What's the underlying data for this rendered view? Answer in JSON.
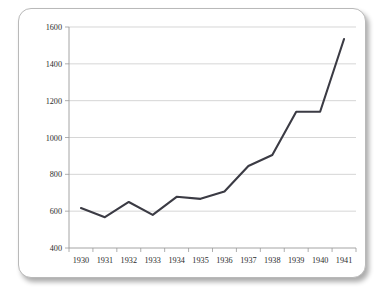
{
  "chart_data": {
    "type": "line",
    "title": "",
    "subtitle": "",
    "xlabel": "",
    "ylabel": "",
    "categories": [
      "1930",
      "1931",
      "1932",
      "1933",
      "1934",
      "1935",
      "1936",
      "1937",
      "1938",
      "1939",
      "1940",
      "1941"
    ],
    "x": [
      1930,
      1931,
      1932,
      1933,
      1934,
      1935,
      1936,
      1937,
      1938,
      1939,
      1940,
      1941
    ],
    "values": [
      617,
      567,
      650,
      580,
      678,
      667,
      707,
      845,
      905,
      1140,
      1140,
      1535
    ],
    "series": [
      {
        "name": "",
        "values": [
          617,
          567,
          650,
          580,
          678,
          667,
          707,
          845,
          905,
          1140,
          1140,
          1535
        ]
      }
    ],
    "ylim": [
      400,
      1600
    ],
    "yticks": [
      400,
      600,
      800,
      1000,
      1200,
      1400,
      1600
    ],
    "ytick_labels": [
      "400",
      "600",
      "800",
      "1000",
      "1200",
      "1400",
      "1600"
    ],
    "xtick_labels": [
      "1930",
      "1931",
      "1932",
      "1933",
      "1934",
      "1935",
      "1936",
      "1937",
      "1938",
      "1939",
      "1940",
      "1941"
    ],
    "grid": true,
    "grid_axis": "y",
    "legend": false,
    "legend_position": "none",
    "annotations": [],
    "colors": {
      "line": "#3b3b44",
      "grid": "#c4c4c4",
      "axis": "#9a9a9a",
      "text": "#2b2b2b",
      "background": "#ffffff",
      "card_border": "#b9b9b9"
    }
  }
}
